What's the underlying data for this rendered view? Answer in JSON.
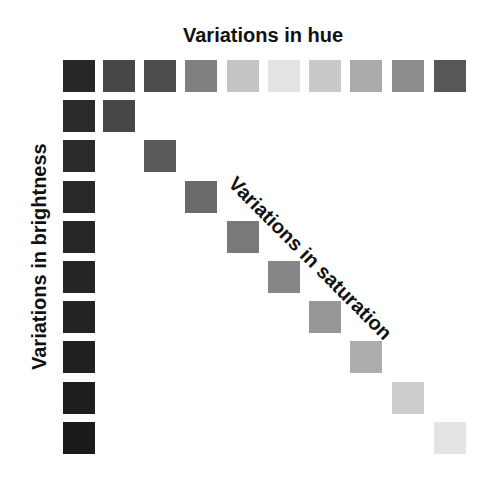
{
  "labels": {
    "hue": "Variations in hue",
    "brightness": "Variations in brightness",
    "saturation": "Variations in saturation"
  },
  "hue_row": {
    "x": [
      63,
      103,
      144,
      185,
      227,
      268,
      309,
      350,
      392,
      434
    ],
    "y": 60,
    "colors": [
      "#262626",
      "#474747",
      "#4c4c4c",
      "#808080",
      "#c4c4c4",
      "#e3e3e3",
      "#c9c9c9",
      "#ababab",
      "#8c8c8c",
      "#585858"
    ]
  },
  "brightness_column": {
    "x": 63,
    "y": [
      100,
      140,
      181,
      221,
      261,
      301,
      341,
      382,
      422
    ],
    "colors": [
      "#2a2a2a",
      "#2a2a2a",
      "#282828",
      "#262626",
      "#252525",
      "#232323",
      "#212121",
      "#1e1e1e",
      "#1b1b1b"
    ]
  },
  "saturation_diagonal": {
    "x": [
      103,
      144,
      185,
      227,
      268,
      309,
      350,
      392,
      434
    ],
    "y": [
      100,
      140,
      181,
      221,
      261,
      301,
      341,
      382,
      422
    ],
    "colors": [
      "#474747",
      "#5a5a5a",
      "#6a6a6a",
      "#797979",
      "#878787",
      "#979797",
      "#adadad",
      "#cccccc",
      "#e4e4e4"
    ]
  }
}
